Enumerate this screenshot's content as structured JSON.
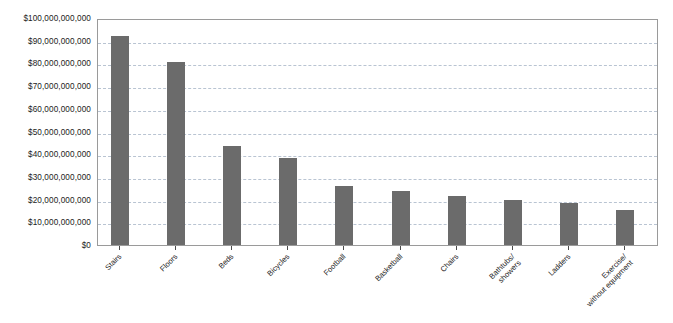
{
  "chart_data": {
    "type": "bar",
    "title": "",
    "xlabel": "",
    "ylabel": "",
    "ylim": [
      0,
      100000000000
    ],
    "grid": true,
    "legend": "none",
    "orientation": "vertical",
    "bar_color": "#6b6b6b",
    "gridline_color": "#b9c4d2",
    "axis_color": "#9a9a9a",
    "y_tick_labels": [
      "$100,000,000,000",
      "$90,000,000,000",
      "$80,000,000,000",
      "$70,000,000,000",
      "$60,000,000,000",
      "$50,000,000,000",
      "$40,000,000,000",
      "$30,000,000,000",
      "$20,000,000,000",
      "$10,000,000,000",
      "$0"
    ],
    "y_tick_values": [
      100000000000,
      90000000000,
      80000000000,
      70000000000,
      60000000000,
      50000000000,
      40000000000,
      30000000000,
      20000000000,
      10000000000,
      0
    ],
    "categories": [
      "Stairs",
      "Floors",
      "Beds",
      "Bicycles",
      "Football",
      "Basketball",
      "Chairs",
      "Bathtubs/\nshowers",
      "Ladders",
      "Exercise/\nwithout equipment"
    ],
    "values": [
      92000000000,
      80500000000,
      43700000000,
      38500000000,
      26000000000,
      24000000000,
      21500000000,
      20000000000,
      18500000000,
      15500000000
    ]
  }
}
